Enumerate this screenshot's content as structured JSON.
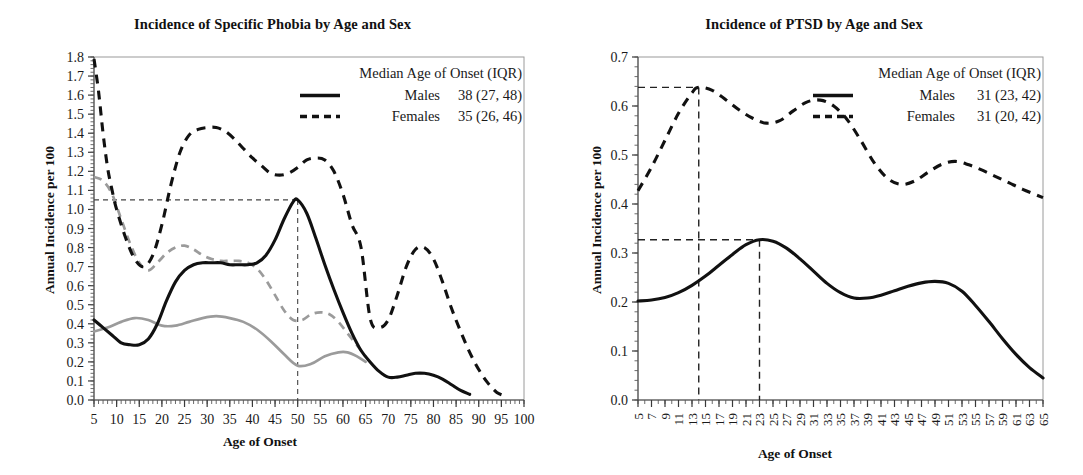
{
  "figure": {
    "background": "#ffffff",
    "ink": "#111111",
    "gray_series_color": "#9b9b9b"
  },
  "chart_data": [
    {
      "id": "specific-phobia",
      "type": "line",
      "title": "Incidence of Specific Phobia by Age and Sex",
      "xlabel": "Age of Onset",
      "ylabel": "Annual Incidence per 100",
      "xlim": [
        5,
        100
      ],
      "ylim": [
        0.0,
        1.8
      ],
      "grid": false,
      "x_ticks_major": [
        5,
        10,
        15,
        20,
        25,
        30,
        35,
        40,
        45,
        50,
        55,
        60,
        65,
        70,
        75,
        80,
        85,
        90,
        95,
        100
      ],
      "x_tick_minor_step": 1,
      "y_ticks_major": [
        0.0,
        0.1,
        0.2,
        0.3,
        0.4,
        0.5,
        0.6,
        0.7,
        0.8,
        0.9,
        1.0,
        1.1,
        1.2,
        1.3,
        1.4,
        1.5,
        1.6,
        1.7,
        1.8
      ],
      "y_tick_labels": [
        "0.0",
        "0.1",
        "0.2",
        "0.3",
        "0.4",
        "0.5",
        "0.6",
        "0.7",
        "0.8",
        "0.9",
        "1.0",
        "1.1",
        "1.2",
        "1.3",
        "1.4",
        "1.5",
        "1.6",
        "1.7",
        "1.8"
      ],
      "legend": {
        "position": "top-right",
        "title": "Median Age of Onset (IQR)",
        "entries": [
          {
            "style": "solid",
            "label": "Males",
            "value": "38 (27, 48)"
          },
          {
            "style": "dashed",
            "label": "Females",
            "value": "35 (26, 46)"
          }
        ]
      },
      "reference_lines": {
        "horizontal_y": 1.05,
        "vertical_x": 50,
        "note": "median male onset marker"
      },
      "series": [
        {
          "name": "Males",
          "style": "solid",
          "color": "#111111",
          "x": [
            5,
            7,
            9,
            11,
            13,
            15,
            17,
            19,
            21,
            23,
            25,
            27,
            29,
            31,
            33,
            35,
            37,
            39,
            41,
            43,
            45,
            47,
            49,
            50,
            52,
            54,
            56,
            58,
            60,
            62,
            64,
            66,
            68,
            70,
            72,
            74,
            76,
            78,
            80,
            82,
            84,
            86,
            88
          ],
          "values": [
            0.42,
            0.38,
            0.34,
            0.3,
            0.29,
            0.29,
            0.32,
            0.4,
            0.52,
            0.62,
            0.68,
            0.71,
            0.72,
            0.72,
            0.72,
            0.71,
            0.71,
            0.71,
            0.72,
            0.76,
            0.84,
            0.95,
            1.04,
            1.05,
            0.98,
            0.85,
            0.71,
            0.58,
            0.46,
            0.35,
            0.26,
            0.2,
            0.15,
            0.12,
            0.12,
            0.13,
            0.14,
            0.14,
            0.13,
            0.11,
            0.08,
            0.05,
            0.03
          ]
        },
        {
          "name": "Females",
          "style": "dashed",
          "color": "#111111",
          "x": [
            5,
            6,
            7,
            8,
            9,
            10,
            12,
            14,
            16,
            18,
            20,
            22,
            24,
            26,
            28,
            30,
            32,
            34,
            36,
            38,
            40,
            42,
            44,
            46,
            48,
            50,
            52,
            54,
            56,
            58,
            60,
            62,
            64,
            66,
            68,
            70,
            72,
            74,
            76,
            78,
            80,
            82,
            84,
            86,
            88,
            90,
            92,
            94,
            96
          ],
          "values": [
            1.79,
            1.62,
            1.4,
            1.22,
            1.1,
            1.0,
            0.85,
            0.74,
            0.7,
            0.76,
            0.92,
            1.13,
            1.3,
            1.39,
            1.42,
            1.43,
            1.43,
            1.41,
            1.37,
            1.32,
            1.27,
            1.23,
            1.19,
            1.18,
            1.19,
            1.22,
            1.26,
            1.27,
            1.26,
            1.2,
            1.08,
            0.92,
            0.8,
            0.43,
            0.38,
            0.42,
            0.55,
            0.7,
            0.79,
            0.8,
            0.74,
            0.62,
            0.48,
            0.36,
            0.25,
            0.16,
            0.09,
            0.04,
            0.02
          ]
        },
        {
          "name": "Males (secondary)",
          "style": "solid",
          "color": "#9b9b9b",
          "x": [
            5,
            8,
            11,
            14,
            17,
            20,
            23,
            26,
            29,
            32,
            35,
            38,
            41,
            44,
            47,
            50,
            53,
            56,
            59,
            61,
            63,
            65
          ],
          "values": [
            0.36,
            0.38,
            0.41,
            0.43,
            0.42,
            0.39,
            0.39,
            0.41,
            0.43,
            0.44,
            0.43,
            0.41,
            0.37,
            0.31,
            0.24,
            0.18,
            0.19,
            0.23,
            0.25,
            0.25,
            0.23,
            0.2
          ]
        },
        {
          "name": "Females (secondary)",
          "style": "dashed",
          "color": "#9b9b9b",
          "x": [
            5,
            7,
            9,
            11,
            13,
            15,
            17,
            19,
            21,
            23,
            25,
            27,
            29,
            31,
            33,
            35,
            37,
            39,
            41,
            43,
            45,
            47,
            49,
            51,
            53,
            55,
            57,
            59,
            61,
            63,
            65
          ],
          "values": [
            1.17,
            1.15,
            1.08,
            0.95,
            0.82,
            0.72,
            0.68,
            0.72,
            0.77,
            0.8,
            0.81,
            0.79,
            0.76,
            0.74,
            0.73,
            0.73,
            0.73,
            0.72,
            0.69,
            0.63,
            0.55,
            0.47,
            0.42,
            0.42,
            0.45,
            0.46,
            0.45,
            0.41,
            0.35,
            0.29,
            0.23
          ]
        }
      ]
    },
    {
      "id": "ptsd",
      "type": "line",
      "title": "Incidence of PTSD by Age and Sex",
      "xlabel": "Age of Onset",
      "ylabel": "Annual Incidence per 100",
      "xlim": [
        5,
        65
      ],
      "ylim": [
        0.0,
        0.7
      ],
      "grid": false,
      "x_ticks_major": [
        5,
        7,
        9,
        11,
        13,
        15,
        17,
        19,
        21,
        23,
        25,
        27,
        29,
        31,
        33,
        35,
        37,
        39,
        41,
        43,
        45,
        47,
        49,
        51,
        53,
        55,
        57,
        59,
        61,
        63,
        65
      ],
      "x_tick_minor_step": 1,
      "y_ticks_major": [
        0.0,
        0.1,
        0.2,
        0.3,
        0.4,
        0.5,
        0.6,
        0.7
      ],
      "y_tick_labels": [
        "0.0",
        "0.1",
        "0.2",
        "0.3",
        "0.4",
        "0.5",
        "0.6",
        "0.7"
      ],
      "legend": {
        "position": "top-right",
        "title": "Median Age of Onset (IQR)",
        "entries": [
          {
            "style": "solid",
            "label": "Males",
            "value": "31 (23, 42)"
          },
          {
            "style": "dashed",
            "label": "Females",
            "value": "31 (20, 42)"
          }
        ]
      },
      "reference_lines": {
        "male_horizontal_y": 0.327,
        "male_vertical_x": 23,
        "female_horizontal_y": 0.638,
        "female_vertical_x": 14
      },
      "series": [
        {
          "name": "Males",
          "style": "solid",
          "color": "#111111",
          "x": [
            5,
            7,
            9,
            11,
            13,
            15,
            17,
            19,
            21,
            23,
            25,
            27,
            29,
            31,
            33,
            35,
            37,
            39,
            41,
            43,
            45,
            47,
            49,
            51,
            53,
            55,
            57,
            59,
            61,
            63,
            65
          ],
          "values": [
            0.202,
            0.204,
            0.209,
            0.219,
            0.234,
            0.253,
            0.275,
            0.297,
            0.317,
            0.327,
            0.324,
            0.31,
            0.288,
            0.263,
            0.238,
            0.219,
            0.208,
            0.208,
            0.214,
            0.223,
            0.232,
            0.239,
            0.242,
            0.238,
            0.222,
            0.193,
            0.16,
            0.125,
            0.093,
            0.066,
            0.045
          ]
        },
        {
          "name": "Females",
          "style": "dashed",
          "color": "#111111",
          "x": [
            5,
            7,
            9,
            11,
            13,
            14,
            16,
            18,
            20,
            22,
            24,
            26,
            28,
            30,
            32,
            34,
            36,
            38,
            40,
            42,
            44,
            46,
            48,
            50,
            52,
            54,
            56,
            58,
            60,
            62,
            65
          ],
          "values": [
            0.427,
            0.475,
            0.53,
            0.585,
            0.627,
            0.638,
            0.632,
            0.613,
            0.592,
            0.575,
            0.565,
            0.57,
            0.59,
            0.608,
            0.612,
            0.6,
            0.572,
            0.53,
            0.484,
            0.452,
            0.44,
            0.447,
            0.465,
            0.481,
            0.487,
            0.48,
            0.469,
            0.456,
            0.443,
            0.43,
            0.413
          ]
        }
      ]
    }
  ]
}
